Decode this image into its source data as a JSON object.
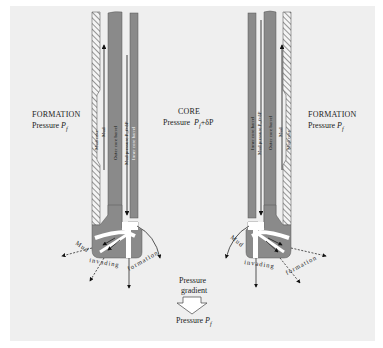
{
  "diagram": {
    "type": "core-barrel cross-section",
    "left_formation": {
      "title": "FORMATION",
      "pressure_label": "Pressure",
      "pressure_symbol": "P",
      "pressure_subscript": "f"
    },
    "core": {
      "title": "CORE",
      "pressure_label": "Pressure",
      "pressure_expr": "P",
      "pressure_subscript": "f",
      "pressure_suffix": "+δP"
    },
    "right_formation": {
      "title": "FORMATION",
      "pressure_label": "Pressure",
      "pressure_symbol": "P",
      "pressure_subscript": "f"
    },
    "left_barrel_labels": {
      "mud_cake": "Mud cake",
      "mud": "Mud",
      "outer_core_barrel": "Outer core barrel",
      "mud_pressure": "Mud pressure P_f+δP",
      "inner_core_barrel": "Inner core barrel"
    },
    "right_barrel_labels": {
      "inner_core_barrel": "Inner core barrel",
      "mud_pressure": "Mud pressure P_f+δP",
      "outer_core_barrel": "Outer core barrel",
      "mud": "Mud",
      "mud_cake": "Mud cake"
    },
    "left_bit_caption": {
      "word1": "Mud",
      "word2": "invading",
      "word3": "formation"
    },
    "right_bit_caption": {
      "word1": "Mud",
      "word2": "invading",
      "word3": "formation"
    },
    "gradient": {
      "line1": "Pressure",
      "line2": "gradient",
      "bottom_label": "Pressure",
      "bottom_symbol": "P",
      "bottom_subscript": "f"
    },
    "colors": {
      "background": "#efefef",
      "barrel": "#8a8a8a",
      "barrel_edge": "#5a5a5a",
      "hatch": "#555555",
      "arrow": "#111111"
    }
  }
}
